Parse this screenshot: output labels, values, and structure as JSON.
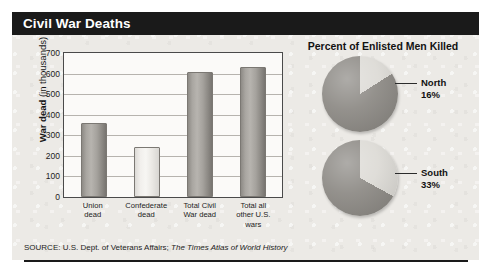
{
  "title": "Civil War Deaths",
  "source": {
    "prefix": "SOURCE: U.S. Dept. of Veterans Affairs;",
    "italic": "The Times Atlas of World History"
  },
  "bar_section": {
    "y_axis_title_bold": "War dead",
    "y_axis_title_regular": " (in thousands)"
  },
  "pie_section": {
    "title": "Percent of Enlisted Men Killed",
    "slices": [
      {
        "name": "North",
        "value": 16,
        "label_line1": "North",
        "label_line2": "16%"
      },
      {
        "name": "South",
        "value": 33,
        "label_line1": "South",
        "label_line2": "33%"
      }
    ]
  },
  "colors": {
    "title_bar": "#1a1a1a",
    "panel_background": "#eceae6",
    "plot_background": "#fbfaf8",
    "bar_dark": "#a5a29d",
    "bar_light": "#eeecE8",
    "pie_dark": "#8b8883",
    "pie_light": "#dcdad5",
    "gridline": "#b6b3ae",
    "text": "#1c1c1c"
  },
  "chart_data": [
    {
      "type": "bar",
      "title": "Civil War Deaths",
      "xlabel": "",
      "ylabel": "War dead (in thousands)",
      "ylim": [
        0,
        700
      ],
      "yticks": [
        0,
        100,
        200,
        300,
        400,
        500,
        600,
        700
      ],
      "ytick_labels": [
        "0",
        "100",
        "200",
        "300",
        "400",
        "500",
        "600",
        "700"
      ],
      "grid": true,
      "legend": "none",
      "categories": [
        "Union dead",
        "Confederate dead",
        "Total Civil War dead",
        "Total all other U.S. wars"
      ],
      "category_lines": [
        [
          "Union",
          "dead"
        ],
        [
          "Confederate",
          "dead"
        ],
        [
          "Total Civil",
          "War dead"
        ],
        [
          "Total all",
          "other U.S.",
          "wars"
        ]
      ],
      "values": [
        360,
        245,
        610,
        630
      ],
      "bar_styles": [
        "dark",
        "light",
        "dark",
        "dark"
      ]
    },
    {
      "type": "pie",
      "title": "Percent of Enlisted Men Killed",
      "subtitle": "North",
      "labels": [
        "North",
        "Other"
      ],
      "values": [
        16,
        84
      ],
      "legend": "callout-right"
    },
    {
      "type": "pie",
      "title": "Percent of Enlisted Men Killed",
      "subtitle": "South",
      "labels": [
        "South",
        "Other"
      ],
      "values": [
        33,
        67
      ],
      "legend": "callout-right"
    }
  ]
}
